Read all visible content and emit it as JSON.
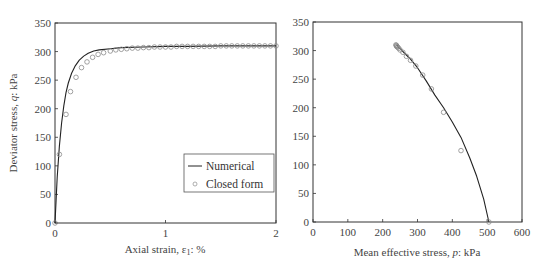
{
  "chart_data": [
    {
      "type": "line",
      "title": "",
      "xlabel": "Axial strain, ε1: %",
      "ylabel": "Deviator stress, q: kPa",
      "xlim": [
        0,
        2
      ],
      "ylim": [
        0,
        350
      ],
      "xticks": [
        0,
        1,
        2
      ],
      "yticks": [
        0,
        50,
        100,
        150,
        200,
        250,
        300,
        350
      ],
      "grid": false,
      "legend": {
        "position": "lower right",
        "entries": [
          "Numerical",
          "Closed form"
        ]
      },
      "series": [
        {
          "name": "Numerical",
          "style": "line",
          "x": [
            0,
            0.01,
            0.02,
            0.04,
            0.06,
            0.08,
            0.1,
            0.12,
            0.15,
            0.18,
            0.22,
            0.26,
            0.3,
            0.35,
            0.4,
            0.5,
            0.6,
            0.8,
            1.0,
            1.2,
            1.5,
            2.0
          ],
          "y": [
            0,
            40,
            80,
            135,
            175,
            205,
            228,
            245,
            262,
            274,
            285,
            292,
            297,
            301,
            303,
            305,
            307,
            308,
            309,
            309,
            310,
            310
          ]
        },
        {
          "name": "Closed form",
          "style": "markers",
          "x": [
            0,
            0.04,
            0.1,
            0.14,
            0.19,
            0.24,
            0.29,
            0.34,
            0.39,
            0.44,
            0.5,
            0.55,
            0.6,
            0.65,
            0.7,
            0.75,
            0.8,
            0.85,
            0.9,
            0.95,
            1.0,
            1.05,
            1.1,
            1.15,
            1.2,
            1.25,
            1.3,
            1.35,
            1.4,
            1.45,
            1.5,
            1.55,
            1.6,
            1.65,
            1.7,
            1.75,
            1.8,
            1.85,
            1.9,
            1.95,
            2.0
          ],
          "y": [
            0,
            120,
            190,
            230,
            255,
            272,
            282,
            290,
            295,
            298,
            301,
            303,
            304,
            305,
            306,
            306,
            307,
            307,
            308,
            308,
            308,
            308,
            309,
            309,
            309,
            309,
            309,
            309,
            309,
            309,
            310,
            310,
            310,
            310,
            310,
            310,
            310,
            310,
            310,
            310,
            310
          ]
        }
      ]
    },
    {
      "type": "line",
      "title": "",
      "xlabel": "Mean effective stress, p: kPa",
      "ylabel": "",
      "xlim": [
        0,
        600
      ],
      "ylim": [
        0,
        350
      ],
      "xticks": [
        0,
        100,
        200,
        300,
        400,
        500,
        600
      ],
      "yticks": [
        0,
        50,
        100,
        150,
        200,
        250,
        300,
        350
      ],
      "grid": false,
      "series": [
        {
          "name": "Numerical",
          "style": "line",
          "x": [
            505,
            490,
            470,
            450,
            425,
            400,
            375,
            350,
            325,
            300,
            280,
            265,
            252,
            245,
            240
          ],
          "y": [
            0,
            40,
            80,
            112,
            148,
            175,
            200,
            222,
            247,
            270,
            285,
            294,
            302,
            306,
            310
          ]
        },
        {
          "name": "Closed form",
          "style": "markers",
          "x": [
            505,
            425,
            375,
            340,
            315,
            295,
            280,
            268,
            258,
            250,
            246,
            243,
            241,
            240,
            239,
            238
          ],
          "y": [
            0,
            125,
            192,
            233,
            257,
            273,
            283,
            290,
            297,
            301,
            304,
            306,
            307,
            308,
            309,
            310
          ]
        }
      ]
    }
  ],
  "left_chart": {
    "ylabel_parts": [
      "Deviator stress, ",
      "q",
      ": kPa"
    ],
    "xlabel_parts": [
      "Axial strain, ε",
      "1",
      ": %"
    ],
    "legend": {
      "numerical": "Numerical",
      "closed_form": "Closed form"
    }
  },
  "right_chart": {
    "xlabel_parts": [
      "Mean effective stress, ",
      "p",
      ": kPa"
    ]
  },
  "colors": {
    "line": "#222222",
    "marker": "#8a8a8a",
    "axis": "#333333"
  }
}
